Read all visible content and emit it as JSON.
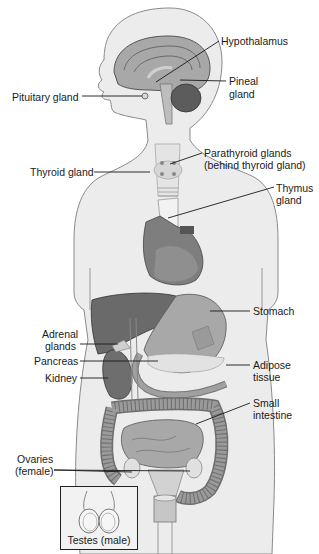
{
  "diagram": {
    "type": "anatomical-illustration",
    "colors": {
      "body_fill": "#ececec",
      "body_outline": "#8a8a8a",
      "organ_dark": "#6e6e6e",
      "organ_mid": "#9a9a9a",
      "organ_light": "#bdbdbd",
      "gland_pale": "#e4e4e4",
      "leader_line": "#1a1a1a",
      "text": "#1a1a1a"
    },
    "labels": {
      "hypothalamus": "Hypothalamus",
      "pineal_1": "Pineal",
      "pineal_2": "gland",
      "pituitary": "Pituitary gland",
      "thyroid": "Thyroid gland",
      "parathyroid_1": "Parathyroid glands",
      "parathyroid_2": "(behind thyroid gland)",
      "thymus_1": "Thymus",
      "thymus_2": "gland",
      "stomach": "Stomach",
      "adrenal_1": "Adrenal",
      "adrenal_2": "glands",
      "pancreas": "Pancreas",
      "kidney": "Kidney",
      "adipose_1": "Adipose",
      "adipose_2": "tissue",
      "small_intestine_1": "Small",
      "small_intestine_2": "intestine",
      "ovaries_1": "Ovaries",
      "ovaries_2": "(female)",
      "testes": "Testes (male)"
    }
  }
}
